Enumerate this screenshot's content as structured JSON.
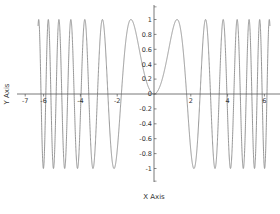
{
  "chart_data": {
    "type": "line",
    "title": "",
    "function": "y = sin(x^2)",
    "xlabel": "X Axis",
    "ylabel": "Y Axis",
    "xlim": [
      -7,
      6.6
    ],
    "ylim": [
      -1.2,
      1.2
    ],
    "grid": false,
    "legend": null,
    "x_ticks": [
      -7,
      -6,
      -4,
      -2,
      2,
      4,
      6
    ],
    "x_tick_labels": [
      "-7",
      "-6",
      "-4",
      "-2",
      "2",
      "4",
      "6"
    ],
    "y_ticks": [
      1,
      0.8,
      0.6,
      0.4,
      0.2,
      0,
      -0.2,
      -0.4,
      -0.6,
      -0.8,
      -1
    ],
    "y_tick_labels": [
      "1",
      "0.8",
      "0.6",
      "0.4",
      "0.2",
      "0",
      "-0.2",
      "-0.4",
      "-0.6",
      "-0.8",
      "-1"
    ],
    "series": [
      {
        "name": "sin(x^2)",
        "x_range": [
          -6.3,
          6.3
        ],
        "color": "#8a8a8a",
        "sample_points": [
          {
            "x": -6.3,
            "y": -0.4
          },
          {
            "x": -1.77,
            "y": 0.0
          },
          {
            "x": -1.25,
            "y": 1.0
          },
          {
            "x": 0,
            "y": 0
          },
          {
            "x": 1.25,
            "y": 1.0
          },
          {
            "x": 1.77,
            "y": 0.0
          },
          {
            "x": 2.17,
            "y": -1.0
          },
          {
            "x": 6.3,
            "y": -0.73
          }
        ]
      }
    ]
  },
  "axes": {
    "x_title": "X Axis",
    "y_title": "Y Axis",
    "axis_color": "#555555",
    "curve_color": "#8a8a8a"
  }
}
